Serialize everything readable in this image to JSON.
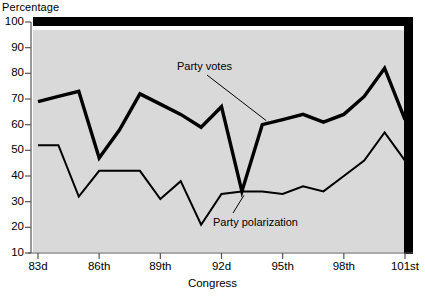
{
  "chart_data": {
    "type": "line",
    "title": "",
    "xlabel": "Congress",
    "ylabel": "Percentage",
    "ylim": [
      10,
      100
    ],
    "ytick_labels": [
      "100",
      "90",
      "80",
      "70",
      "60",
      "50",
      "40",
      "30",
      "20",
      "10"
    ],
    "ytick_values": [
      100,
      90,
      80,
      70,
      60,
      50,
      40,
      30,
      20,
      10
    ],
    "xtick_labels": [
      "83d",
      "86th",
      "89th",
      "92d",
      "95th",
      "98th",
      "101st"
    ],
    "xtick_values": [
      83,
      86,
      89,
      92,
      95,
      98,
      101
    ],
    "x": [
      83,
      84,
      85,
      86,
      87,
      88,
      89,
      90,
      91,
      92,
      93,
      94,
      95,
      96,
      97,
      98,
      99,
      100,
      101
    ],
    "grid": false,
    "legend_position": "inline-annotations",
    "series": [
      {
        "name": "Party votes",
        "values": [
          69,
          71,
          73,
          47,
          58,
          72,
          68,
          64,
          59,
          67,
          34,
          60,
          62,
          64,
          61,
          64,
          71,
          82,
          62
        ],
        "annotation": "Party votes"
      },
      {
        "name": "Party polarization",
        "values": [
          52,
          52,
          32,
          42,
          42,
          42,
          31,
          38,
          21,
          33,
          34,
          34,
          33,
          36,
          34,
          40,
          46,
          57,
          46
        ],
        "annotation": "Party polarization"
      }
    ],
    "annotations": [
      {
        "text": "Party votes",
        "series": "Party votes"
      },
      {
        "text": "Party polarization",
        "series": "Party polarization"
      }
    ]
  },
  "style": {
    "plot_background": "#d9d9d9",
    "line_color": "#000000",
    "page_background": "#ffffff"
  }
}
